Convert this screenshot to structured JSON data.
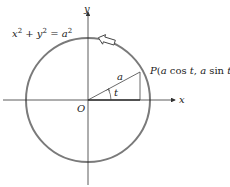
{
  "diagram": {
    "equation": "x² + y² = a²",
    "equation_parts": {
      "x": "x",
      "y": "y",
      "a": "a",
      "exp": "2",
      "plus": " + ",
      "eq": " = "
    },
    "axes": {
      "x_label": "x",
      "y_label": "y",
      "origin_label": "O"
    },
    "point_label": "P(a cos t, a sin t)",
    "point_parts": {
      "P": "P",
      "open": "(",
      "a1": "a",
      "cos": " cos ",
      "t1": "t",
      "comma": ", ",
      "a2": "a",
      "sin": " sin ",
      "t2": "t",
      "close": ")"
    },
    "radius_label": "a",
    "angle_label": "t",
    "direction": "counterclockwise",
    "colors": {
      "circle": "#7a7a7a",
      "axes": "#333333",
      "lines": "#444444"
    }
  }
}
